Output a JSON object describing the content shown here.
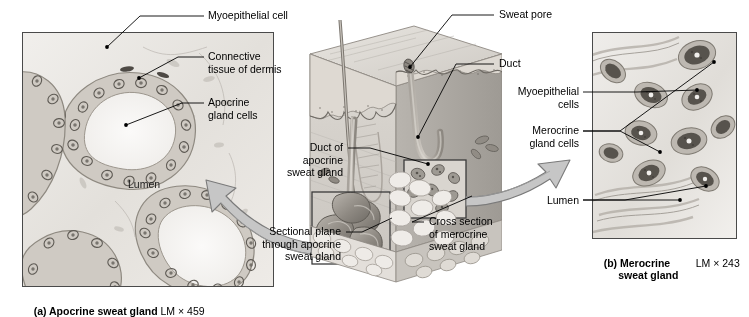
{
  "figure": {
    "type": "anatomy-histology-figure"
  },
  "panel_a": {
    "caption_bold": "(a) Apocrine sweat gland",
    "caption_mag": "LM × 459",
    "overlay_label": "Lumen",
    "labels": [
      {
        "text": "Myoepithelial cell"
      },
      {
        "text": "Connective\ntissue of dermis"
      },
      {
        "text": "Apocrine\ngland cells"
      }
    ]
  },
  "panel_b": {
    "caption_bold": "(b) Merocrine\n     sweat gland",
    "caption_mag": "LM × 243",
    "labels": [
      {
        "text": "Myoepithelial\ncells"
      },
      {
        "text": "Merocrine\ngland cells"
      },
      {
        "text": "Lumen"
      }
    ]
  },
  "center_diagram": {
    "labels": [
      {
        "text": "Sweat pore"
      },
      {
        "text": "Duct"
      },
      {
        "text": "Duct of\napocrine\nsweat gland"
      },
      {
        "text": "Sectional plane\nthrough apocrine\nsweat gland"
      },
      {
        "text": "Cross section\nof merocrine\nsweat gland"
      }
    ]
  },
  "colors": {
    "arrow_fill": "#c6c6c6",
    "arrow_stroke": "#7a7a7a",
    "leader_line": "#000000",
    "panel_border": "#4a4a4a",
    "skin_light": "#dcd9d4",
    "skin_mid": "#c2bfb9",
    "skin_dark": "#9b9791",
    "gland_dark": "#8d8a85",
    "background": "#ffffff"
  }
}
